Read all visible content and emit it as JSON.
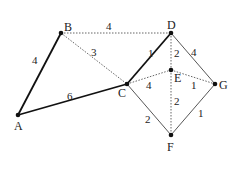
{
  "diagram": {
    "type": "weighted-graph",
    "nodes": [
      {
        "id": "A",
        "label": "A",
        "x": 18,
        "y": 115
      },
      {
        "id": "B",
        "label": "B",
        "x": 61,
        "y": 33
      },
      {
        "id": "C",
        "label": "C",
        "x": 127,
        "y": 84
      },
      {
        "id": "D",
        "label": "D",
        "x": 171,
        "y": 33
      },
      {
        "id": "E",
        "label": "E",
        "x": 171,
        "y": 70
      },
      {
        "id": "G",
        "label": "G",
        "x": 215,
        "y": 84
      },
      {
        "id": "F",
        "label": "F",
        "x": 171,
        "y": 135
      }
    ],
    "edges": [
      {
        "from": "A",
        "to": "B",
        "weight": "4",
        "style": "solid-bold"
      },
      {
        "from": "A",
        "to": "C",
        "weight": "6",
        "style": "solid-bold"
      },
      {
        "from": "B",
        "to": "D",
        "weight": "4",
        "style": "dotted"
      },
      {
        "from": "B",
        "to": "C",
        "weight": "3",
        "style": "dotted"
      },
      {
        "from": "C",
        "to": "D",
        "weight": "1",
        "style": "solid-bold"
      },
      {
        "from": "C",
        "to": "E",
        "weight": "4",
        "style": "dotted"
      },
      {
        "from": "D",
        "to": "E",
        "weight": "2",
        "style": "dotted"
      },
      {
        "from": "D",
        "to": "G",
        "weight": "4",
        "style": "solid-thin"
      },
      {
        "from": "E",
        "to": "G",
        "weight": "1",
        "style": "dotted"
      },
      {
        "from": "E",
        "to": "F",
        "weight": "2",
        "style": "dotted"
      },
      {
        "from": "C",
        "to": "F",
        "weight": "2",
        "style": "solid-thin"
      },
      {
        "from": "G",
        "to": "F",
        "weight": "1",
        "style": "solid-thin"
      }
    ]
  }
}
